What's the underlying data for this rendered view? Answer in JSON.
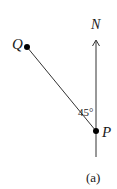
{
  "diagram": {
    "type": "bearing-diagram",
    "labels": {
      "north": "N",
      "point_q": "Q",
      "point_p": "P",
      "angle": "45°",
      "caption": "(a)"
    },
    "angle_degrees": 45,
    "colors": {
      "line": "#333333",
      "point": "#000000",
      "text": "#1a1a1a",
      "background": "#ffffff"
    }
  }
}
